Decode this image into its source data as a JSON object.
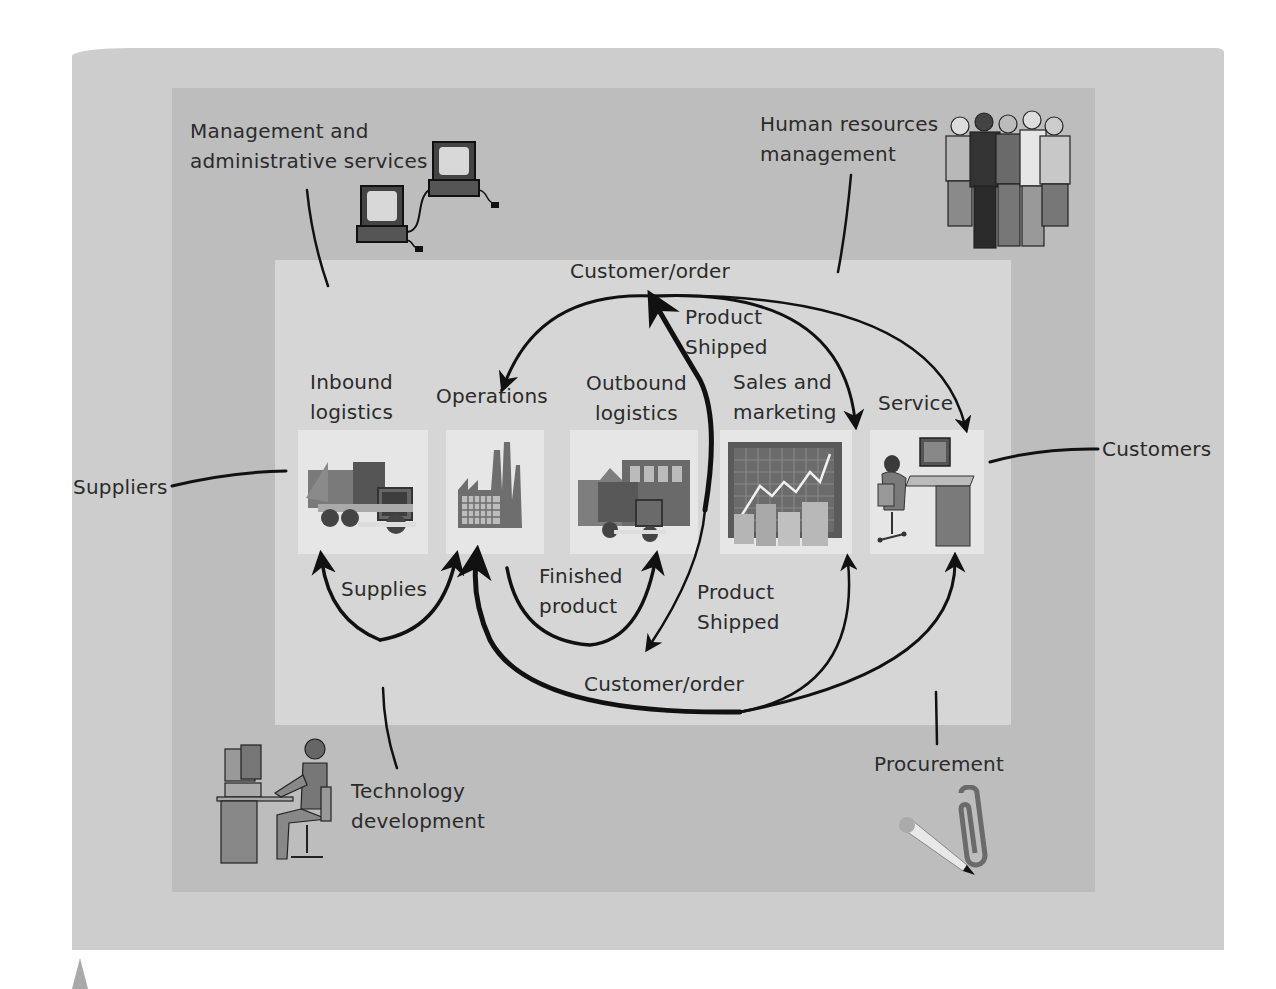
{
  "diagram": {
    "colors": {
      "outer_panel": "#cdcdcd",
      "middle_panel": "#bdbdbd",
      "inner_panel": "#d6d6d6",
      "tile": "#e6e6e6",
      "ink": "#111111"
    },
    "support_activities": {
      "management": [
        "Management and",
        "administrative services"
      ],
      "human_resources": [
        "Human resources",
        "management"
      ],
      "technology": [
        "Technology",
        "development"
      ],
      "procurement": "Procurement"
    },
    "external": {
      "suppliers": "Suppliers",
      "customers": "Customers"
    },
    "primary_activities": [
      {
        "id": "inbound",
        "lines": [
          "Inbound",
          "logistics"
        ],
        "icon": "truck-icon"
      },
      {
        "id": "operations",
        "lines": [
          "Operations"
        ],
        "icon": "factory-icon"
      },
      {
        "id": "outbound",
        "lines": [
          "Outbound",
          "logistics"
        ],
        "icon": "truck-warehouse-icon"
      },
      {
        "id": "sales",
        "lines": [
          "Sales and",
          "marketing"
        ],
        "icon": "sales-chart-icon"
      },
      {
        "id": "service",
        "lines": [
          "Service"
        ],
        "icon": "service-desk-icon"
      }
    ],
    "flows": {
      "top_customer_order": "Customer/order",
      "top_product_shipped": [
        "Product",
        "Shipped"
      ],
      "supplies": "Supplies",
      "finished_product": [
        "Finished",
        "product"
      ],
      "bottom_product_shipped": [
        "Product",
        "Shipped"
      ],
      "bottom_customer_order": "Customer/order"
    },
    "illustrations": [
      "computers-icon",
      "people-group-icon",
      "person-at-computer-icon",
      "pencil-paperclip-icon"
    ]
  }
}
